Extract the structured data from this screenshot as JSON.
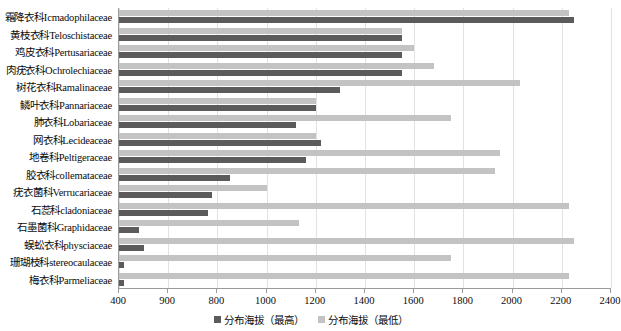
{
  "chart_data": {
    "type": "bar",
    "orientation": "horizontal",
    "title": "",
    "xlabel": "",
    "ylabel": "",
    "xlim": [
      400,
      2400
    ],
    "grid": true,
    "legend_position": "bottom",
    "xticks": [
      400,
      900,
      800,
      1000,
      1200,
      1400,
      1600,
      1800,
      2000,
      2200,
      2400
    ],
    "categories": [
      "霜降衣科Icmadophilaceae",
      "黄枝衣科Teloschistaceae",
      "鸡皮衣科Pertusariaceae",
      "肉疣衣科Ochrolechiaceae",
      "树花衣科Ramalinaceae",
      "鳞叶衣科Pannariaceae",
      "肺衣科Lobariaceae",
      "网衣科Lecideaceae",
      "地卷科Peltigeraceae",
      "胶衣科collemataceae",
      "疣衣菌科Verrucariaceae",
      "石蕊科cladoniaceae",
      "石墨菌科Graphidaceae",
      "蜈蚣衣科physciaceae",
      "珊瑚枝科stereocaulaceae",
      "梅衣科Parmeliaceae"
    ],
    "series": [
      {
        "name": "分布海拔（最高）",
        "color": "#5b5b5b",
        "values": [
          2250,
          1550,
          1550,
          1550,
          1300,
          1200,
          1120,
          1220,
          1160,
          850,
          780,
          760,
          480,
          500,
          420,
          420
        ]
      },
      {
        "name": "分布海拔（最低）",
        "color": "#c3c3c3",
        "values": [
          2230,
          1550,
          1600,
          1680,
          2030,
          1200,
          1750,
          1200,
          1950,
          1930,
          1000,
          2230,
          1130,
          2250,
          1750,
          2230
        ]
      }
    ]
  },
  "legend": {
    "items": [
      {
        "label": "分布海拔（最高）",
        "swatch": "max-swatch"
      },
      {
        "label": "分布海拔（最低）",
        "swatch": "min-swatch"
      }
    ]
  }
}
